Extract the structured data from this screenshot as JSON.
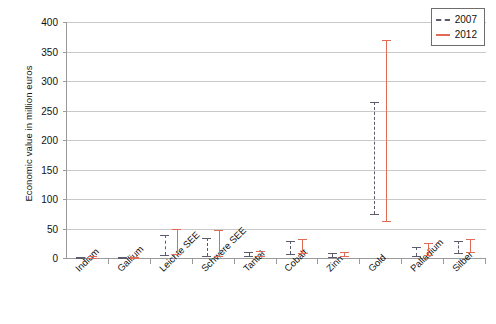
{
  "ghost_title": "",
  "legend": {
    "position": "top-right",
    "entries": [
      {
        "label": "2007",
        "color": "#5b5b6e",
        "style": "dashed"
      },
      {
        "label": "2012",
        "color": "#e06a56",
        "style": "solid"
      }
    ]
  },
  "chart_data": {
    "type": "bar",
    "subtype": "range-bars",
    "title": "",
    "xlabel": "",
    "ylabel": "Economic value in million euros",
    "ylim": [
      0,
      400
    ],
    "yticks": [
      0,
      50,
      100,
      150,
      200,
      250,
      300,
      350,
      400
    ],
    "ytick_labels": [
      "0",
      "50",
      "100",
      "150",
      "200",
      "250",
      "300",
      "350",
      "400"
    ],
    "grid": true,
    "categories": [
      "Indium",
      "Gallium",
      "Leichte SEE",
      "Schwere SEE",
      "Tantal",
      "Cobalt",
      "Zinn",
      "Gold",
      "Palladium",
      "Silber"
    ],
    "series": [
      {
        "name": "2007",
        "color": "#5b5b6e",
        "low": [
          0,
          0,
          5,
          3,
          3,
          7,
          2,
          75,
          4,
          9
        ],
        "high": [
          2,
          1,
          39,
          34,
          10,
          29,
          9,
          265,
          18,
          29
        ]
      },
      {
        "name": "2012",
        "color": "#e06a56",
        "low": [
          0,
          0,
          6,
          4,
          3,
          8,
          3,
          62,
          5,
          10
        ],
        "high": [
          3,
          2,
          50,
          48,
          12,
          33,
          11,
          370,
          25,
          33
        ]
      }
    ]
  }
}
